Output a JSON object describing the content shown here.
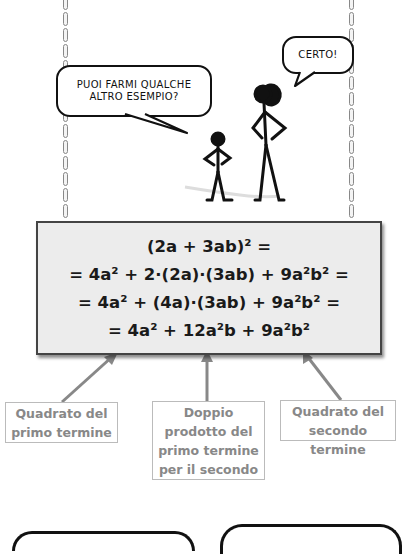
{
  "comic": {
    "bubble_left": {
      "line1": "PUOI FARMI QUALCHE",
      "line2": "ALTRO ESEMPIO?"
    },
    "bubble_right": {
      "text": "CERTO!"
    }
  },
  "formula": {
    "lines": [
      "(2a + 3ab)² =",
      "= 4a² + 2·(2a)·(3ab) + 9a²b² =",
      "= 4a² + (4a)·(3ab) + 9a²b² =",
      "= 4a² + 12a²b + 9a²b²"
    ]
  },
  "labels": [
    {
      "line1": "Quadrato del",
      "line2": "primo termine"
    },
    {
      "line1": "Doppio",
      "line2": "prodotto del",
      "line3": "primo termine",
      "line4": "per il secondo"
    },
    {
      "line1": "Quadrato del",
      "line2": "secondo termine"
    }
  ],
  "colors": {
    "box_bg": "#ececec",
    "box_border": "#444444",
    "arrow": "#888888",
    "label_text": "#888888"
  }
}
